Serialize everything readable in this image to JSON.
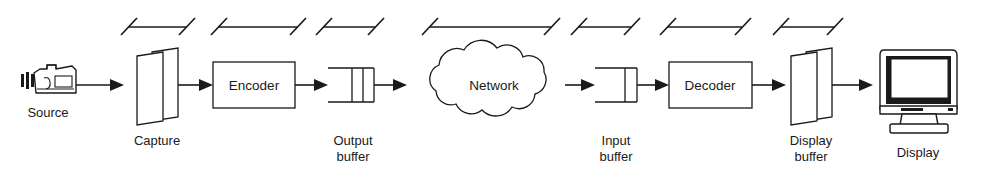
{
  "diagram": {
    "type": "block-flow",
    "orientation": "left-to-right",
    "background_color": "#ffffff",
    "line_color": "#1a1a1a",
    "nodes": [
      {
        "id": "source",
        "label": "Source",
        "shape": "camcorder-icon",
        "label_position": "below",
        "x": 48,
        "y": 85
      },
      {
        "id": "capture",
        "label": "Capture",
        "shape": "double-frame",
        "label_position": "below",
        "x": 152,
        "y": 85
      },
      {
        "id": "encoder",
        "label": "Encoder",
        "shape": "rectangle",
        "label_position": "inside",
        "x": 253,
        "y": 85
      },
      {
        "id": "output-buffer",
        "label": "Output\nbuffer",
        "label_line_1": "Output",
        "label_line_2": "buffer",
        "shape": "queue-two-slots",
        "label_position": "below",
        "x": 352,
        "y": 85
      },
      {
        "id": "network",
        "label": "Network",
        "shape": "cloud",
        "label_position": "inside",
        "x": 494,
        "y": 85
      },
      {
        "id": "input-buffer",
        "label": "Input\nbuffer",
        "label_line_1": "Input",
        "label_line_2": "buffer",
        "shape": "queue-one-slot",
        "label_position": "below",
        "x": 616,
        "y": 85
      },
      {
        "id": "decoder",
        "label": "Decoder",
        "shape": "rectangle",
        "label_position": "inside",
        "x": 709,
        "y": 85
      },
      {
        "id": "display-buffer",
        "label": "Display\nbuffer",
        "label_line_1": "Display",
        "label_line_2": "buffer",
        "shape": "double-frame",
        "label_position": "below",
        "x": 806,
        "y": 85
      },
      {
        "id": "display",
        "label": "Display",
        "shape": "crt-monitor-icon",
        "label_position": "below",
        "x": 916,
        "y": 85
      }
    ],
    "connections": [
      {
        "from": "source",
        "to": "capture",
        "style": "arrow"
      },
      {
        "from": "capture",
        "to": "encoder",
        "style": "arrow"
      },
      {
        "from": "encoder",
        "to": "output-buffer",
        "style": "arrow"
      },
      {
        "from": "output-buffer",
        "to": "network",
        "style": "arrow"
      },
      {
        "from": "network",
        "to": "input-buffer",
        "style": "arrow"
      },
      {
        "from": "input-buffer",
        "to": "decoder",
        "style": "arrow"
      },
      {
        "from": "decoder",
        "to": "display-buffer",
        "style": "arrow"
      },
      {
        "from": "display-buffer",
        "to": "display",
        "style": "arrow"
      }
    ],
    "span_markers": {
      "description": "Dimension spans with slanted end ticks above the pipeline",
      "count": 7,
      "y": 27,
      "items": [
        {
          "index": 1,
          "label": "",
          "x1": 123,
          "x2": 192
        },
        {
          "index": 2,
          "label": "",
          "x1": 213,
          "x2": 303
        },
        {
          "index": 3,
          "label": "",
          "x1": 318,
          "x2": 381
        },
        {
          "index": 4,
          "label": "",
          "x1": 424,
          "x2": 557
        },
        {
          "index": 5,
          "label": "",
          "x1": 573,
          "x2": 637
        },
        {
          "index": 6,
          "label": "",
          "x1": 662,
          "x2": 748
        },
        {
          "index": 7,
          "label": "",
          "x1": 775,
          "x2": 840
        }
      ]
    }
  }
}
